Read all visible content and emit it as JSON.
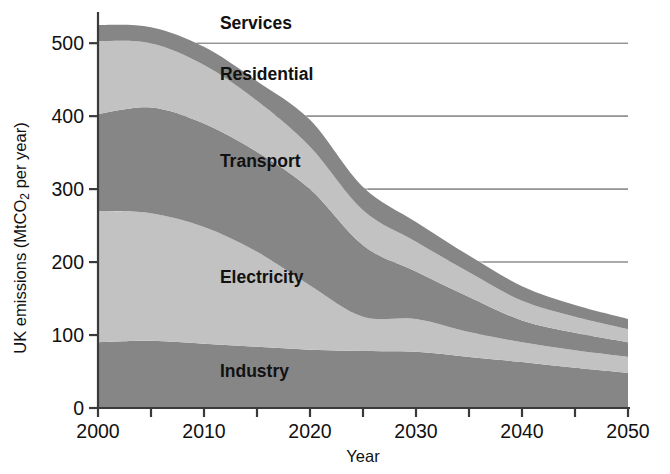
{
  "chart_data": {
    "type": "area",
    "title": "",
    "subtitle": "",
    "xlabel": "Year",
    "ylabel": "UK emissions (MtCO2 per year)",
    "ylabel_parts": {
      "pre": "UK emissions (MtCO",
      "sub": "2",
      "post": " per year)"
    },
    "xlim": [
      2000,
      2050
    ],
    "ylim": [
      0,
      540
    ],
    "grid": "horizontal",
    "legend": "inline-labels",
    "stacked": true,
    "stack_order_bottom_to_top": [
      "Industry",
      "Electricity",
      "Transport",
      "Residential",
      "Services"
    ],
    "x": [
      2000,
      2005,
      2010,
      2015,
      2020,
      2025,
      2030,
      2035,
      2040,
      2045,
      2050
    ],
    "series": [
      {
        "name": "Industry",
        "color": "#868686",
        "values": [
          90,
          92,
          88,
          84,
          80,
          78,
          77,
          70,
          63,
          55,
          48
        ]
      },
      {
        "name": "Electricity",
        "color": "#c2c2c2",
        "values": [
          180,
          175,
          160,
          130,
          88,
          47,
          45,
          34,
          27,
          24,
          22
        ]
      },
      {
        "name": "Transport",
        "color": "#868686",
        "values": [
          133,
          145,
          142,
          137,
          132,
          98,
          65,
          48,
          30,
          24,
          20
        ]
      },
      {
        "name": "Residential",
        "color": "#c2c2c2",
        "values": [
          100,
          88,
          80,
          70,
          58,
          48,
          41,
          34,
          27,
          22,
          18
        ]
      },
      {
        "name": "Services",
        "color": "#868686",
        "values": [
          22,
          22,
          25,
          27,
          37,
          32,
          27,
          23,
          20,
          16,
          14
        ]
      }
    ],
    "totals": [
      525,
      522,
      495,
      448,
      395,
      303,
      255,
      209,
      167,
      141,
      122
    ],
    "x_ticks": [
      {
        "value": 2000,
        "label": "2000"
      },
      {
        "value": 2005,
        "label": ""
      },
      {
        "value": 2010,
        "label": "2010"
      },
      {
        "value": 2015,
        "label": ""
      },
      {
        "value": 2020,
        "label": "2020"
      },
      {
        "value": 2025,
        "label": ""
      },
      {
        "value": 2030,
        "label": "2030"
      },
      {
        "value": 2035,
        "label": ""
      },
      {
        "value": 2040,
        "label": "2040"
      },
      {
        "value": 2045,
        "label": ""
      },
      {
        "value": 2050,
        "label": "2050"
      }
    ],
    "y_ticks": [
      {
        "value": 0,
        "label": "0"
      },
      {
        "value": 100,
        "label": "100"
      },
      {
        "value": 200,
        "label": "200"
      },
      {
        "value": 300,
        "label": "300"
      },
      {
        "value": 400,
        "label": "400"
      },
      {
        "value": 500,
        "label": "500"
      }
    ],
    "series_labels": [
      {
        "text": "Services",
        "x": 2011.5,
        "y": 520
      },
      {
        "text": "Residential",
        "x": 2011.5,
        "y": 450
      },
      {
        "text": "Transport",
        "x": 2011.5,
        "y": 330
      },
      {
        "text": "Electricity",
        "x": 2011.5,
        "y": 172
      },
      {
        "text": "Industry",
        "x": 2011.5,
        "y": 42
      }
    ],
    "colors": {
      "dark_band": "#868686",
      "light_band": "#c2c2c2",
      "grid": "#8e8e8e",
      "axis": "#3a3a3a",
      "text": "#111111",
      "background": "#ffffff"
    }
  }
}
